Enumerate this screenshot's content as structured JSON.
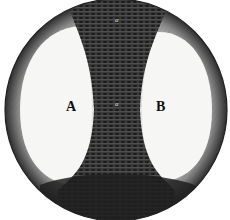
{
  "figure": {
    "labels": {
      "left_lobe": "A",
      "right_lobe": "B",
      "center": "a",
      "top": "a"
    },
    "colors": {
      "background": "#ffffff",
      "light_lobe": "#f4f4f2",
      "dark_band": "#2a2a2a",
      "rim": "#5a5a5a",
      "ink": "#111111"
    }
  }
}
